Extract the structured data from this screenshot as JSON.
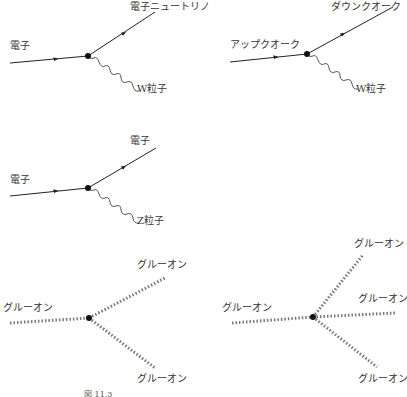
{
  "diagrams": [
    {
      "id": "electron-to-neutrino-W",
      "labels": {
        "in": "電子",
        "out_fermion": "電子ニュートリノ",
        "boson": "W粒子"
      }
    },
    {
      "id": "up-to-down-W",
      "labels": {
        "in": "アップクオーク",
        "out_fermion": "ダウンクオーク",
        "boson": "W粒子"
      }
    },
    {
      "id": "electron-to-electron-Z",
      "labels": {
        "in": "電子",
        "out_fermion": "電子",
        "boson": "Z粒子"
      }
    },
    {
      "id": "three-gluon-vertex",
      "labels": {
        "in": "グルーオン",
        "out_upper": "グルーオン",
        "out_lower": "グルーオン"
      }
    },
    {
      "id": "four-gluon-vertex",
      "labels": {
        "in": "グルーオン",
        "out_upper": "グルーオン",
        "out_middle": "グルーオン",
        "out_lower": "グルーオン"
      }
    }
  ],
  "caption": {
    "figure_number": "図 11.3",
    "note": "caption text cut off at bottom edge of image"
  }
}
